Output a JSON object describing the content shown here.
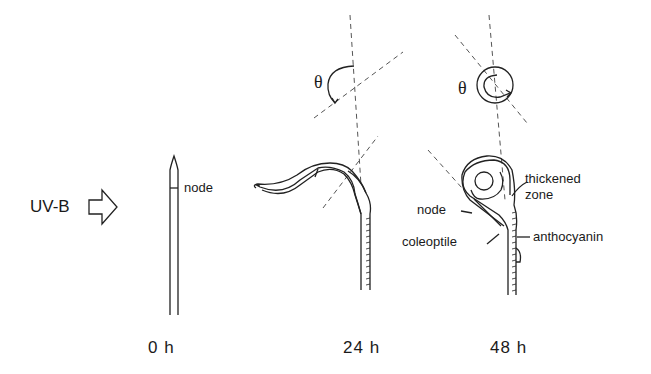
{
  "diagram": {
    "stimulus": {
      "label": "UV-B",
      "icon": "hollow-arrow-right"
    },
    "stages": [
      {
        "time": "0 h",
        "labels": [
          "node"
        ]
      },
      {
        "time": "24 h",
        "angle_symbol": "θ"
      },
      {
        "time": "48 h",
        "angle_symbol": "θ",
        "labels": [
          "thickened",
          "zone",
          "node",
          "coleoptile",
          "anthocyanin"
        ]
      }
    ]
  }
}
